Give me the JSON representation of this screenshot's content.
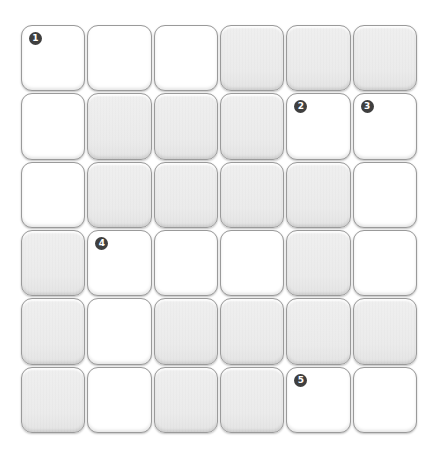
{
  "puzzle": {
    "type": "crossword-grid",
    "rows": 6,
    "cols": 6,
    "colors": {
      "open_cell": "#ffffff",
      "blocked_cell": "#ececec",
      "cell_border": "#9a9a9a",
      "clue_badge": "#3f3f3f",
      "clue_text": "#ffffff"
    },
    "grid": [
      [
        {
          "state": "open",
          "num": "1"
        },
        {
          "state": "open",
          "num": ""
        },
        {
          "state": "open",
          "num": ""
        },
        {
          "state": "blocked",
          "num": ""
        },
        {
          "state": "blocked",
          "num": ""
        },
        {
          "state": "blocked",
          "num": ""
        }
      ],
      [
        {
          "state": "open",
          "num": ""
        },
        {
          "state": "blocked",
          "num": ""
        },
        {
          "state": "blocked",
          "num": ""
        },
        {
          "state": "blocked",
          "num": ""
        },
        {
          "state": "open",
          "num": "2"
        },
        {
          "state": "open",
          "num": "3"
        }
      ],
      [
        {
          "state": "open",
          "num": ""
        },
        {
          "state": "blocked",
          "num": ""
        },
        {
          "state": "blocked",
          "num": ""
        },
        {
          "state": "blocked",
          "num": ""
        },
        {
          "state": "blocked",
          "num": ""
        },
        {
          "state": "open",
          "num": ""
        }
      ],
      [
        {
          "state": "blocked",
          "num": ""
        },
        {
          "state": "open",
          "num": "4"
        },
        {
          "state": "open",
          "num": ""
        },
        {
          "state": "open",
          "num": ""
        },
        {
          "state": "blocked",
          "num": ""
        },
        {
          "state": "open",
          "num": ""
        }
      ],
      [
        {
          "state": "blocked",
          "num": ""
        },
        {
          "state": "open",
          "num": ""
        },
        {
          "state": "blocked",
          "num": ""
        },
        {
          "state": "blocked",
          "num": ""
        },
        {
          "state": "blocked",
          "num": ""
        },
        {
          "state": "blocked",
          "num": ""
        }
      ],
      [
        {
          "state": "blocked",
          "num": ""
        },
        {
          "state": "open",
          "num": ""
        },
        {
          "state": "blocked",
          "num": ""
        },
        {
          "state": "blocked",
          "num": ""
        },
        {
          "state": "open",
          "num": "5"
        },
        {
          "state": "open",
          "num": ""
        }
      ]
    ],
    "clue_numbers": [
      "1",
      "2",
      "3",
      "4",
      "5"
    ]
  }
}
